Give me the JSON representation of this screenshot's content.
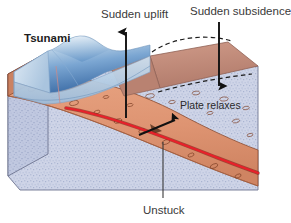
{
  "figure": {
    "kind": "geology-cross-section-block-diagram",
    "background_color": "#ffffff",
    "width": 291,
    "height": 223
  },
  "labels": {
    "tsunami": "Tsunami",
    "sudden_uplift": "Sudden uplift",
    "sudden_subsidence": "Sudden subsidence",
    "plate_relaxes": "Plate relaxes",
    "unstuck": "Unstuck"
  },
  "colors": {
    "water_light": "#cfe0ef",
    "water_mid": "#8fb4d8",
    "water_deep": "#3f6fa8",
    "water_side": "#b9cfe3",
    "land_top": "#c08a7a",
    "land_top_shadow": "#ab7768",
    "crust": "#de9472",
    "crust_dark": "#c77a58",
    "crust_outline": "#8c4a2e",
    "mantle": "#ced4e7",
    "mantle_side": "#bcc4dc",
    "fault_red": "#e8202a",
    "arrow_black": "#111111",
    "dashed_black": "#1a1a1a",
    "label_gray": "#3a3a3a"
  },
  "annotations": [
    {
      "name": "sudden-uplift-arrow",
      "direction": "up",
      "description": "vertical arrow rising from the fault through the ocean block"
    },
    {
      "name": "sudden-subsidence-arrow",
      "direction": "down",
      "description": "vertical arrow descending onto the landward block top"
    },
    {
      "name": "unstuck-leader-line",
      "direction": "up",
      "description": "leader line from the Unstuck label up to the fault plane"
    },
    {
      "name": "slip-arrow",
      "direction": "up-right",
      "description": "black arrow along the fault plane showing slip motion"
    },
    {
      "name": "former-position-dashed-arc",
      "description": "dashed arc above landward block showing former bulged position"
    },
    {
      "name": "former-position-dashed-line",
      "description": "dashed line inside crust showing former plate position"
    }
  ]
}
